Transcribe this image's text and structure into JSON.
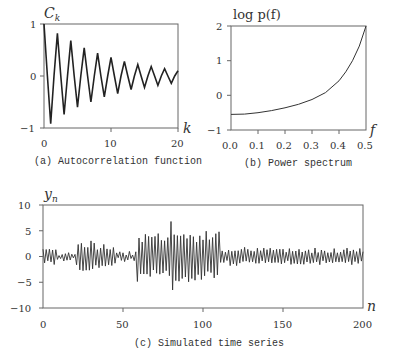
{
  "chart_data": [
    {
      "type": "line",
      "panel": "a",
      "title": "(a) Autocorrelation function",
      "xlabel": "k",
      "ylabel": "C_k",
      "xlim": [
        0,
        20
      ],
      "ylim": [
        -1,
        1
      ],
      "xticks": [
        "0",
        "10",
        "20"
      ],
      "yticks": [
        "1",
        "0",
        "−1"
      ],
      "grid": false,
      "x": [
        0,
        1,
        2,
        3,
        4,
        5,
        6,
        7,
        8,
        9,
        10,
        11,
        12,
        13,
        14,
        15,
        16,
        17,
        18,
        19,
        20
      ],
      "values": [
        1.0,
        -0.92,
        0.82,
        -0.74,
        0.68,
        -0.6,
        0.54,
        -0.5,
        0.44,
        -0.4,
        0.36,
        -0.34,
        0.28,
        -0.26,
        0.22,
        -0.22,
        0.18,
        -0.18,
        0.14,
        -0.14,
        0.1
      ]
    },
    {
      "type": "line",
      "panel": "b",
      "title": "(b) Power spectrum",
      "xlabel": "f",
      "ylabel": "log p(f)",
      "xlim": [
        0,
        0.5
      ],
      "ylim": [
        -1,
        2
      ],
      "xticks": [
        "0.0",
        "0.1",
        "0.2",
        "0.3",
        "0.4",
        "0.5"
      ],
      "yticks": [
        "2",
        "1",
        "0",
        "−1"
      ],
      "grid": false,
      "x": [
        0.0,
        0.05,
        0.1,
        0.15,
        0.2,
        0.25,
        0.3,
        0.35,
        0.4,
        0.425,
        0.45,
        0.475,
        0.5
      ],
      "values": [
        -0.55,
        -0.54,
        -0.5,
        -0.44,
        -0.36,
        -0.26,
        -0.12,
        0.08,
        0.42,
        0.68,
        1.0,
        1.42,
        2.0
      ]
    },
    {
      "type": "line",
      "panel": "c",
      "title": "(c) Simulated time series",
      "xlabel": "n",
      "ylabel": "y_n",
      "xlim": [
        0,
        200
      ],
      "ylim": [
        -10,
        10
      ],
      "xticks": [
        "0",
        "50",
        "100",
        "150",
        "200"
      ],
      "yticks": [
        "10",
        "5",
        "0",
        "−5",
        "−10"
      ],
      "grid": false,
      "n_points": 201,
      "envelope": [
        {
          "n_range": [
            0,
            8
          ],
          "amplitude": 1.8
        },
        {
          "n_range": [
            8,
            20
          ],
          "amplitude": 0.7
        },
        {
          "n_range": [
            20,
            32
          ],
          "amplitude": 3.2
        },
        {
          "n_range": [
            32,
            45
          ],
          "amplitude": 2.2
        },
        {
          "n_range": [
            45,
            58
          ],
          "amplitude": 0.9
        },
        {
          "n_range": [
            58,
            110
          ],
          "amplitude": 5.0
        },
        {
          "n_range": [
            110,
            200
          ],
          "amplitude": 1.6
        }
      ],
      "max_value": 6.8,
      "min_value": -6.5
    }
  ],
  "labels": {
    "a": {
      "caption": "(a) Autocorrelation function",
      "ylabel_main": "C",
      "ylabel_sub": "k",
      "xlabel": "k",
      "yticks": [
        "1",
        "0",
        "−1"
      ],
      "xticks": [
        "0",
        "10",
        "20"
      ]
    },
    "b": {
      "caption": "(b) Power spectrum",
      "ylabel": "log p(f)",
      "xlabel": "f",
      "yticks": [
        "2",
        "1",
        "0",
        "−1"
      ],
      "xticks": [
        "0.0",
        "0.1",
        "0.2",
        "0.3",
        "0.4",
        "0.5"
      ]
    },
    "c": {
      "caption": "(c) Simulated time series",
      "ylabel_main": "y",
      "ylabel_sub": "n",
      "xlabel": "n",
      "yticks": [
        "10",
        "5",
        "0",
        "−5",
        "−10"
      ],
      "xticks": [
        "0",
        "50",
        "100",
        "150",
        "200"
      ]
    }
  },
  "colors": {
    "line": "#222222",
    "axis": "#555555",
    "text": "#333333",
    "background": "#ffffff"
  }
}
